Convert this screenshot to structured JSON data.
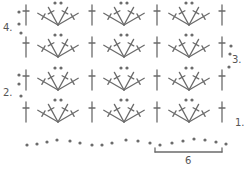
{
  "diagram": {
    "ink_color": "#6b6b6b",
    "row_labels": [
      {
        "text": "1.",
        "x": 235,
        "y": 118
      },
      {
        "text": "2.",
        "x": 3,
        "y": 88
      },
      {
        "text": "3.",
        "x": 232,
        "y": 55
      },
      {
        "text": "4.",
        "x": 3,
        "y": 23
      }
    ],
    "repeat_label": "6",
    "rows": [
      {
        "row": 1,
        "base_y": 122
      },
      {
        "row": 2,
        "base_y": 90
      },
      {
        "row": 3,
        "base_y": 57
      },
      {
        "row": 4,
        "base_y": 25
      }
    ],
    "post_columns_x": [
      26,
      92,
      157,
      222
    ],
    "shell_centers_x": [
      58,
      124,
      189
    ],
    "symbols": {
      "post": "double-crochet",
      "shell": "5 double-crochet fan with 2 chain",
      "dot": "chain"
    }
  }
}
